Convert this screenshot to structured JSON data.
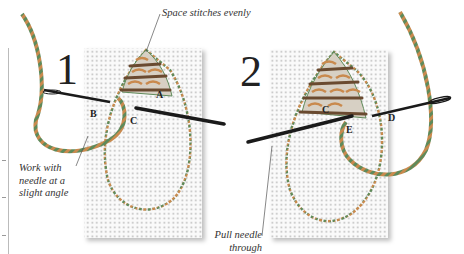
{
  "figure": {
    "steps": [
      {
        "number": "1",
        "point_labels": [
          "A",
          "B",
          "C"
        ]
      },
      {
        "number": "2",
        "point_labels": [
          "C",
          "D",
          "E"
        ]
      }
    ],
    "captions": {
      "top": "Space stitches evenly",
      "left": [
        "Work with",
        "needle at a",
        "slight angle"
      ],
      "bottom": [
        "Pull needle",
        "through"
      ]
    },
    "colors": {
      "canvas_dot": "#b9b9b9",
      "thread_green": "#5f8a5a",
      "thread_orange": "#c98a4e",
      "needle": "#1a1a1a",
      "text": "#333333"
    }
  }
}
